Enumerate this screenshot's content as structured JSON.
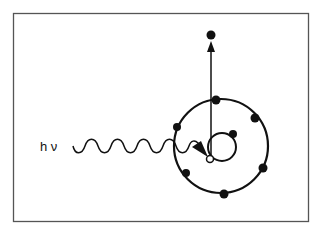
{
  "diagram": {
    "photon_label": "h ν",
    "colors": {
      "line": "#111111",
      "frame": "#555555",
      "background": "#ffffff"
    },
    "frame": {
      "x": 13,
      "y": 13,
      "width": 296,
      "height": 209
    },
    "outer_shell": {
      "cx": 221,
      "cy": 146,
      "r": 47,
      "electrons": [
        [
          216,
          100
        ],
        [
          255,
          118
        ],
        [
          177,
          127
        ],
        [
          263,
          168
        ],
        [
          186,
          173
        ],
        [
          224,
          194
        ]
      ]
    },
    "inner_shell": {
      "cx": 222,
      "cy": 147,
      "r": 14,
      "electrons": [
        [
          233,
          134
        ]
      ],
      "vacancy": [
        210,
        159
      ]
    },
    "ejected_electron": [
      211,
      35
    ]
  }
}
